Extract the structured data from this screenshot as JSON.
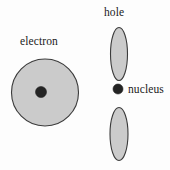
{
  "figure": {
    "background_color": "#fdfdfd",
    "width": 170,
    "height": 170
  },
  "labels": {
    "electron": "electron",
    "hole": "hole",
    "nucleus": "nucleus"
  },
  "colors": {
    "shape_fill": "#cbcbcb",
    "shape_stroke": "#3b3b3b",
    "dot_fill": "#242424",
    "text": "#1a1a1a"
  },
  "shapes": {
    "electron_cloud": {
      "kind": "circle",
      "cx": 45,
      "cy": 92.5,
      "r": 33.5
    },
    "electron_nucleus_dot": {
      "kind": "circle",
      "cx": 41,
      "cy": 92,
      "r": 5.5
    },
    "hole_lobe_upper": {
      "kind": "ellipse",
      "cx": 119,
      "cy": 54,
      "rx": 8.5,
      "ry": 26.5
    },
    "hole_nucleus_dot": {
      "kind": "circle",
      "cx": 118,
      "cy": 89,
      "r": 5
    },
    "hole_lobe_lower": {
      "kind": "ellipse",
      "cx": 119,
      "cy": 134,
      "rx": 9,
      "ry": 26.5
    }
  }
}
